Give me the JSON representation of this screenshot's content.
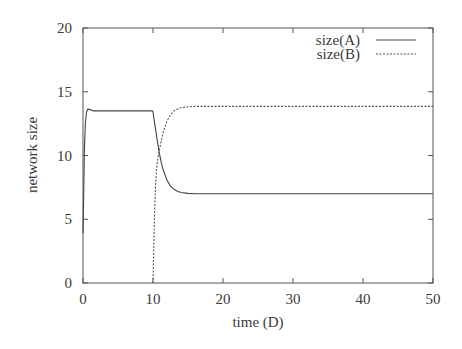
{
  "chart_data": {
    "type": "line",
    "title": "",
    "xlabel": "time (D)",
    "ylabel": "network size",
    "xlim": [
      0,
      50
    ],
    "ylim": [
      0,
      20
    ],
    "xticks": [
      0,
      10,
      20,
      30,
      40,
      50
    ],
    "yticks": [
      0,
      5,
      10,
      15,
      20
    ],
    "grid": false,
    "legend_position": "top-right",
    "series": [
      {
        "name": "size(A)",
        "style": "solid",
        "color": "#444444",
        "x": [
          0,
          0.1,
          0.2,
          0.35,
          0.5,
          0.7,
          1.0,
          1.5,
          2,
          4,
          6,
          8,
          9.9,
          10.0,
          10.3,
          10.6,
          10.9,
          11.2,
          11.5,
          12.0,
          12.5,
          13.0,
          13.5,
          14.0,
          15.0,
          16.0,
          18.0,
          20.0,
          30.0,
          40.0,
          50.0
        ],
        "y": [
          3.9,
          7.0,
          10.5,
          12.6,
          13.4,
          13.65,
          13.6,
          13.5,
          13.5,
          13.5,
          13.5,
          13.5,
          13.5,
          13.4,
          12.3,
          11.2,
          10.2,
          9.4,
          8.8,
          8.05,
          7.6,
          7.35,
          7.2,
          7.1,
          7.03,
          7.0,
          7.0,
          7.0,
          7.0,
          7.0,
          7.0
        ]
      },
      {
        "name": "size(B)",
        "style": "dashed",
        "color": "#555555",
        "x": [
          10.0,
          10.1,
          10.2,
          10.35,
          10.5,
          10.7,
          10.9,
          11.2,
          11.5,
          12.0,
          12.5,
          13.0,
          13.5,
          14.0,
          15.0,
          16.0,
          18.0,
          20.0,
          30.0,
          40.0,
          50.0
        ],
        "y": [
          0.0,
          2.5,
          5.0,
          7.5,
          8.9,
          9.8,
          10.4,
          11.2,
          11.9,
          12.7,
          13.2,
          13.5,
          13.65,
          13.75,
          13.82,
          13.85,
          13.85,
          13.85,
          13.85,
          13.85,
          13.85
        ]
      }
    ]
  },
  "legend": {
    "items": [
      {
        "label": "size(A)",
        "style": "solid"
      },
      {
        "label": "size(B)",
        "style": "dashed"
      }
    ]
  },
  "colors": {
    "frame": "#555555",
    "text": "#3a3a3a",
    "background": "#ffffff"
  }
}
